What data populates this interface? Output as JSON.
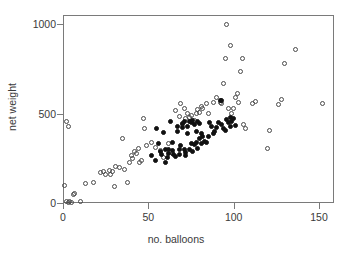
{
  "chart_data": {
    "type": "scatter",
    "title": "",
    "xlabel": "no. balloons",
    "ylabel": "net weight",
    "xlim": [
      -5,
      164
    ],
    "ylim": [
      -60,
      1050
    ],
    "xticks": [
      0,
      50,
      100,
      150
    ],
    "yticks": [
      0,
      500,
      1000
    ],
    "xtick_labels": [
      "0",
      "50",
      "100",
      "150"
    ],
    "ytick_labels": [
      "0",
      "500",
      "1000"
    ],
    "grid": false,
    "legend": "none",
    "frame": true,
    "series": [
      {
        "name": "open",
        "marker": "open-circle",
        "color": "#4a4a4a",
        "points": [
          [
            2,
            455
          ],
          [
            3,
            430
          ],
          [
            1,
            95
          ],
          [
            2,
            10
          ],
          [
            3,
            5
          ],
          [
            4,
            8
          ],
          [
            5,
            5
          ],
          [
            6,
            45
          ],
          [
            7,
            55
          ],
          [
            10,
            10
          ],
          [
            13,
            110
          ],
          [
            18,
            112
          ],
          [
            22,
            172
          ],
          [
            24,
            175
          ],
          [
            25,
            160
          ],
          [
            27,
            182
          ],
          [
            28,
            160
          ],
          [
            29,
            175
          ],
          [
            30,
            90
          ],
          [
            31,
            205
          ],
          [
            33,
            200
          ],
          [
            35,
            360
          ],
          [
            36,
            185
          ],
          [
            38,
            115
          ],
          [
            39,
            225
          ],
          [
            40,
            265
          ],
          [
            41,
            250
          ],
          [
            42,
            290
          ],
          [
            43,
            275
          ],
          [
            44,
            305
          ],
          [
            45,
            225
          ],
          [
            46,
            240
          ],
          [
            47,
            470
          ],
          [
            48,
            415
          ],
          [
            49,
            320
          ],
          [
            52,
            340
          ],
          [
            54,
            310
          ],
          [
            57,
            295
          ],
          [
            59,
            255
          ],
          [
            62,
            330
          ],
          [
            64,
            275
          ],
          [
            66,
            515
          ],
          [
            68,
            485
          ],
          [
            69,
            555
          ],
          [
            70,
            440
          ],
          [
            71,
            530
          ],
          [
            72,
            470
          ],
          [
            73,
            500
          ],
          [
            74,
            480
          ],
          [
            75,
            490
          ],
          [
            77,
            460
          ],
          [
            78,
            500
          ],
          [
            79,
            520
          ],
          [
            80,
            505
          ],
          [
            81,
            540
          ],
          [
            82,
            530
          ],
          [
            84,
            555
          ],
          [
            85,
            500
          ],
          [
            88,
            560
          ],
          [
            90,
            590
          ],
          [
            92,
            560
          ],
          [
            93,
            555
          ],
          [
            94,
            665
          ],
          [
            95,
            810
          ],
          [
            96,
            1000
          ],
          [
            97,
            530
          ],
          [
            98,
            880
          ],
          [
            99,
            500
          ],
          [
            100,
            530
          ],
          [
            101,
            590
          ],
          [
            102,
            610
          ],
          [
            103,
            560
          ],
          [
            104,
            735
          ],
          [
            105,
            805
          ],
          [
            106,
            440
          ],
          [
            107,
            415
          ],
          [
            111,
            555
          ],
          [
            113,
            565
          ],
          [
            120,
            305
          ],
          [
            121,
            405
          ],
          [
            126,
            550
          ],
          [
            128,
            580
          ],
          [
            130,
            780
          ],
          [
            136,
            855
          ],
          [
            152,
            555
          ]
        ]
      },
      {
        "name": "filled",
        "marker": "filled-circle",
        "color": "#111111",
        "points": [
          [
            52,
            265
          ],
          [
            54,
            240
          ],
          [
            55,
            415
          ],
          [
            56,
            330
          ],
          [
            57,
            290
          ],
          [
            58,
            270
          ],
          [
            59,
            395
          ],
          [
            60,
            300
          ],
          [
            60,
            225
          ],
          [
            61,
            255
          ],
          [
            62,
            300
          ],
          [
            62,
            275
          ],
          [
            63,
            455
          ],
          [
            64,
            340
          ],
          [
            64,
            295
          ],
          [
            65,
            270
          ],
          [
            66,
            260
          ],
          [
            67,
            430
          ],
          [
            67,
            400
          ],
          [
            68,
            300
          ],
          [
            68,
            270
          ],
          [
            69,
            320
          ],
          [
            70,
            445
          ],
          [
            70,
            420
          ],
          [
            71,
            455
          ],
          [
            71,
            300
          ],
          [
            72,
            280
          ],
          [
            72,
            265
          ],
          [
            73,
            430
          ],
          [
            73,
            390
          ],
          [
            74,
            455
          ],
          [
            74,
            300
          ],
          [
            75,
            450
          ],
          [
            75,
            330
          ],
          [
            76,
            460
          ],
          [
            76,
            290
          ],
          [
            77,
            440
          ],
          [
            77,
            325
          ],
          [
            78,
            400
          ],
          [
            78,
            340
          ],
          [
            79,
            455
          ],
          [
            79,
            305
          ],
          [
            80,
            445
          ],
          [
            80,
            360
          ],
          [
            81,
            390
          ],
          [
            81,
            330
          ],
          [
            82,
            370
          ],
          [
            83,
            345
          ],
          [
            84,
            340
          ],
          [
            85,
            370
          ],
          [
            86,
            450
          ],
          [
            87,
            425
          ],
          [
            88,
            390
          ],
          [
            89,
            400
          ],
          [
            90,
            420
          ],
          [
            91,
            450
          ],
          [
            92,
            575
          ],
          [
            93,
            570
          ],
          [
            93,
            440
          ],
          [
            94,
            415
          ],
          [
            95,
            405
          ],
          [
            96,
            465
          ],
          [
            97,
            450
          ],
          [
            98,
            480
          ],
          [
            98,
            425
          ],
          [
            99,
            455
          ],
          [
            100,
            470
          ],
          [
            101,
            435
          ]
        ]
      }
    ]
  },
  "axes": {
    "x_label": "no. balloons",
    "y_label": "net weight"
  }
}
